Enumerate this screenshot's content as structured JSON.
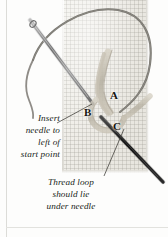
{
  "figure": {
    "fabric_label": "aida-cloth-swatch",
    "background_color": "#fdfdfc",
    "fabric_color": "#eceae4",
    "thread_color": "#b9b4a7",
    "dark_thread_color": "#5f5c57",
    "needle_color": "#8c8c8c",
    "dark_needle_color": "#1c1c1c",
    "ink_color": "#201d19"
  },
  "point_labels": [
    {
      "id": "label-a",
      "text": "A",
      "x": 110,
      "y": 90
    },
    {
      "id": "label-b",
      "text": "B",
      "x": 84,
      "y": 107
    },
    {
      "id": "label-c",
      "text": "C",
      "x": 113,
      "y": 121
    }
  ],
  "captions": {
    "insert_needle": {
      "lines": [
        "Insert",
        "needle to",
        "left of",
        "start point"
      ],
      "align": "right"
    },
    "thread_loop": {
      "lines": [
        "Thread loop",
        "should lie",
        "under needle"
      ],
      "align": "center"
    }
  }
}
